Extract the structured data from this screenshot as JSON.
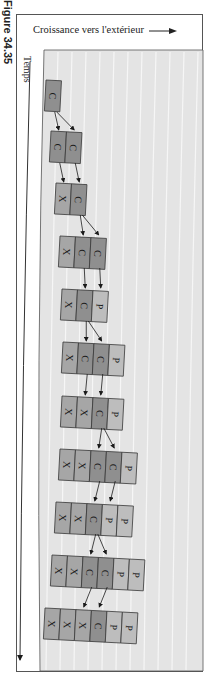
{
  "figure": {
    "caption": "Figure 34.35",
    "growth_label": "Croissance vers l'extérieur",
    "time_label": "Temps"
  },
  "colors": {
    "panel_bg": "#e4e4e4",
    "stripe": "#f6f6f6",
    "cell_C": "#8f8f8f",
    "cell_X": "#a6a6a6",
    "cell_P": "#bdbdbd",
    "cell_border": "#3a3a3a",
    "arrow": "#1a1a1a"
  },
  "rows": [
    {
      "x": 46,
      "y": 80,
      "cells": [
        "C"
      ]
    },
    {
      "x": 51,
      "y": 131,
      "cells": [
        "C",
        "C"
      ]
    },
    {
      "x": 56,
      "y": 183,
      "cells": [
        "X",
        "C"
      ]
    },
    {
      "x": 60,
      "y": 236,
      "cells": [
        "X",
        "C",
        "C"
      ]
    },
    {
      "x": 62,
      "y": 289,
      "cells": [
        "X",
        "C",
        "P"
      ]
    },
    {
      "x": 63,
      "y": 342,
      "cells": [
        "X",
        "C",
        "C",
        "P"
      ]
    },
    {
      "x": 62,
      "y": 396,
      "cells": [
        "X",
        "X",
        "C",
        "P"
      ]
    },
    {
      "x": 60,
      "y": 449,
      "cells": [
        "X",
        "X",
        "C",
        "C",
        "P"
      ]
    },
    {
      "x": 56,
      "y": 502,
      "cells": [
        "X",
        "X",
        "C",
        "P",
        "P"
      ]
    },
    {
      "x": 52,
      "y": 555,
      "cells": [
        "X",
        "X",
        "C",
        "C",
        "P",
        "P"
      ]
    },
    {
      "x": 45,
      "y": 608,
      "cells": [
        "X",
        "X",
        "X",
        "C",
        "P",
        "P"
      ]
    }
  ]
}
